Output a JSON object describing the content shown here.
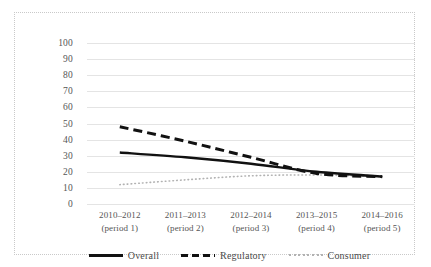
{
  "chart_data": {
    "type": "line",
    "title": "",
    "subtitle": "",
    "xlabel": "",
    "ylabel": "",
    "ylim": [
      0,
      100
    ],
    "y_ticks": [
      0,
      10,
      20,
      30,
      40,
      50,
      60,
      70,
      80,
      90,
      100
    ],
    "grid": true,
    "legend_position": "bottom",
    "curve": "smooth",
    "categories": [
      "2010–2012 (period 1)",
      "2011–2013 (period 2)",
      "2012–2014 (period 3)",
      "2013–2015 (period 4)",
      "2014–2016 (period 5)"
    ],
    "category_lines": [
      {
        "range": "2010–2012",
        "period": "(period 1)"
      },
      {
        "range": "2011–2013",
        "period": "(period 2)"
      },
      {
        "range": "2012–2014",
        "period": "(period 3)"
      },
      {
        "range": "2013–2015",
        "period": "(period 4)"
      },
      {
        "range": "2014–2016",
        "period": "(period 5)"
      }
    ],
    "series": [
      {
        "name": "Overall",
        "style": "solid",
        "color": "#111111",
        "values": [
          32,
          29,
          25,
          20,
          17
        ]
      },
      {
        "name": "Regulatory",
        "style": "dashed",
        "color": "#111111",
        "values": [
          48,
          39,
          29,
          19,
          17
        ]
      },
      {
        "name": "Consumer",
        "style": "dotted",
        "color": "#b2b2b2",
        "values": [
          12,
          15,
          17.5,
          18,
          17
        ]
      }
    ]
  },
  "y_tick_labels": {
    "t100": "100",
    "t90": "90",
    "t80": "80",
    "t70": "70",
    "t60": "60",
    "t50": "50",
    "t40": "40",
    "t30": "30",
    "t20": "20",
    "t10": "10",
    "t0": "0"
  },
  "x_tick_labels": [
    {
      "range": "2010–2012",
      "period": "(period 1)"
    },
    {
      "range": "2011–2013",
      "period": "(period 2)"
    },
    {
      "range": "2012–2014",
      "period": "(period 3)"
    },
    {
      "range": "2013–2015",
      "period": "(period 4)"
    },
    {
      "range": "2014–2016",
      "period": "(period 5)"
    }
  ],
  "legend": {
    "items": [
      {
        "label": "Overall",
        "style": "solid",
        "icon": "solid-line-icon"
      },
      {
        "label": "Regulatory",
        "style": "dashed",
        "icon": "dashed-line-icon"
      },
      {
        "label": "Consumer",
        "style": "dotted",
        "icon": "dotted-line-icon"
      }
    ]
  },
  "colors": {
    "grid": "#e4e4e4",
    "frame": "#c9c9c9",
    "text": "#555555",
    "overall": "#111111",
    "regulatory": "#111111",
    "consumer": "#b2b2b2",
    "background": "#ffffff"
  }
}
